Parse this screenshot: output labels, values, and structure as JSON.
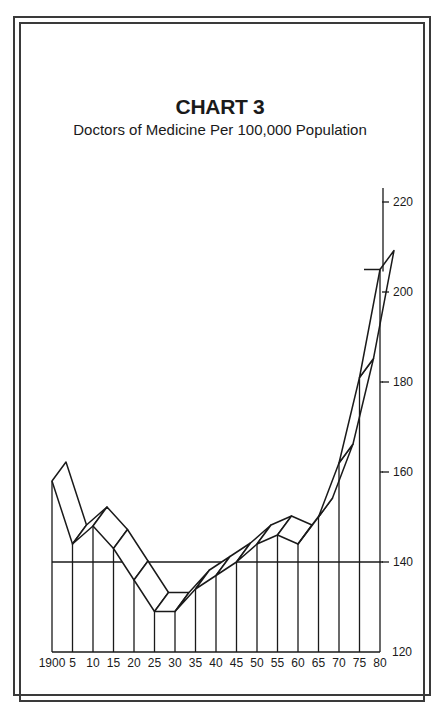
{
  "header": {
    "title": "CHART 3",
    "subtitle": "Doctors of Medicine Per 100,000 Population"
  },
  "chart_data": {
    "type": "line",
    "style": "3d-ribbon",
    "title": "CHART 3",
    "subtitle": "Doctors of Medicine Per 100,000 Population",
    "xlabel": "",
    "ylabel": "",
    "x": [
      "1900",
      "5",
      "10",
      "15",
      "20",
      "25",
      "30",
      "35",
      "40",
      "45",
      "50",
      "55",
      "60",
      "65",
      "70",
      "75",
      "80"
    ],
    "years": [
      1900,
      1905,
      1910,
      1915,
      1920,
      1925,
      1930,
      1935,
      1940,
      1945,
      1950,
      1955,
      1960,
      1965,
      1970,
      1975,
      1980
    ],
    "series": [
      {
        "name": "Doctors of Medicine per 100,000 population",
        "values": [
          158,
          144,
          148,
          143,
          136,
          129,
          129,
          134,
          137,
          140,
          144,
          146,
          144,
          150,
          162,
          181,
          205
        ]
      }
    ],
    "yticks": [
      120,
      140,
      160,
      180,
      200,
      220
    ],
    "ylim": [
      120,
      220
    ],
    "grid": "partial horizontal at 140, 160, 180",
    "axis_position": "right"
  }
}
